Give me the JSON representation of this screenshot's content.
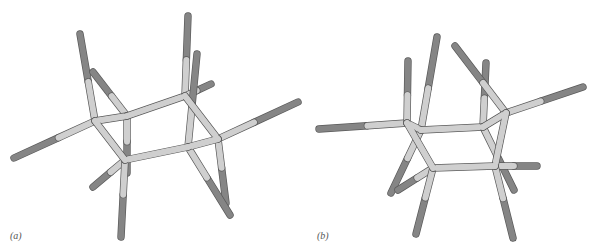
{
  "figure": {
    "colors": {
      "ring_bond": "#cfcfcf",
      "substituent_tip": "#858585",
      "outline": "#5a5a5a",
      "label": "#555555"
    },
    "panels": [
      {
        "id": "a",
        "label": "(a)",
        "ring_atoms": [
          [
            95,
            121
          ],
          [
            127,
            116
          ],
          [
            185,
            96
          ],
          [
            218,
            139
          ],
          [
            188,
            147
          ],
          [
            125,
            160
          ]
        ],
        "substituents": [
          {
            "from": 0,
            "to": [
              80,
              34
            ]
          },
          {
            "from": 0,
            "to": [
              14,
              158
            ]
          },
          {
            "from": 1,
            "to": [
              93,
              72
            ]
          },
          {
            "from": 1,
            "to": [
              127,
              173
            ]
          },
          {
            "from": 2,
            "to": [
              188,
              16
            ]
          },
          {
            "from": 2,
            "to": [
              211,
              84
            ]
          },
          {
            "from": 3,
            "to": [
              298,
              102
            ]
          },
          {
            "from": 3,
            "to": [
              226,
              203
            ]
          },
          {
            "from": 4,
            "to": [
              197,
              54
            ]
          },
          {
            "from": 4,
            "to": [
              230,
              215
            ]
          },
          {
            "from": 5,
            "to": [
              93,
              187
            ]
          },
          {
            "from": 5,
            "to": [
              121,
              237
            ]
          }
        ]
      },
      {
        "id": "b",
        "label": "(b)",
        "ring_atoms": [
          [
            407,
            123
          ],
          [
            421,
            130
          ],
          [
            483,
            127
          ],
          [
            506,
            113
          ],
          [
            495,
            166
          ],
          [
            433,
            168
          ]
        ],
        "substituents": [
          {
            "from": 0,
            "to": [
              319,
              129
            ]
          },
          {
            "from": 0,
            "to": [
              408,
              61
            ]
          },
          {
            "from": 1,
            "to": [
              437,
              37
            ]
          },
          {
            "from": 1,
            "to": [
              391,
              193
            ]
          },
          {
            "from": 2,
            "to": [
              486,
              63
            ]
          },
          {
            "from": 2,
            "to": [
              514,
              190
            ]
          },
          {
            "from": 3,
            "to": [
              583,
              87
            ]
          },
          {
            "from": 3,
            "to": [
              455,
              46
            ]
          },
          {
            "from": 4,
            "to": [
              537,
              166
            ]
          },
          {
            "from": 4,
            "to": [
              513,
              238
            ]
          },
          {
            "from": 5,
            "to": [
              398,
              190
            ]
          },
          {
            "from": 5,
            "to": [
              416,
              234
            ]
          }
        ]
      }
    ]
  }
}
